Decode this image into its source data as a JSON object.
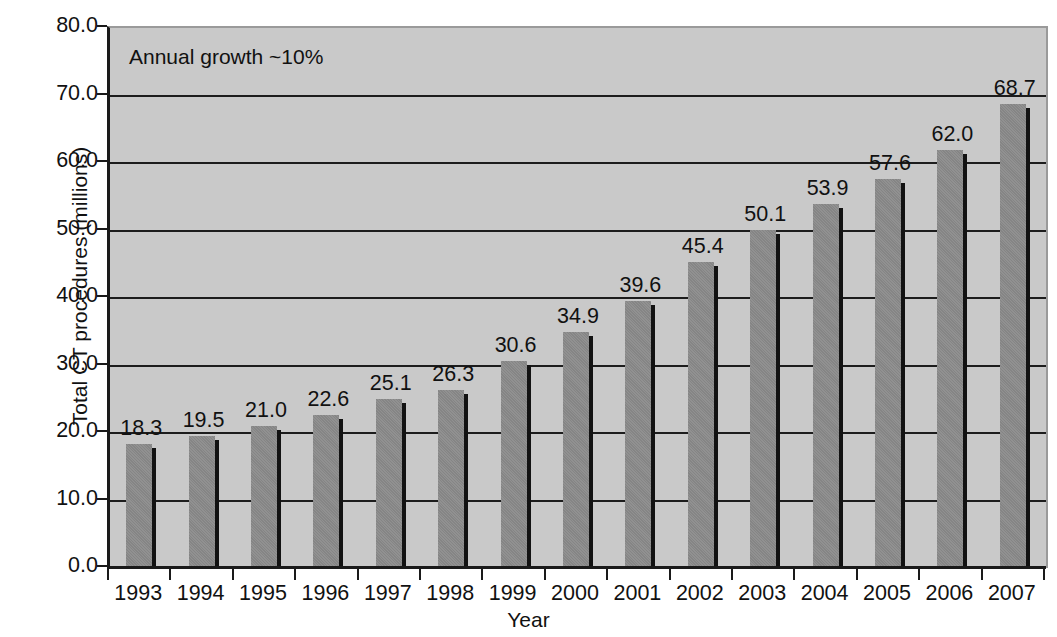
{
  "chart_data": {
    "type": "bar",
    "title": "",
    "xlabel": "Year",
    "ylabel": "Total CT procedures (millions)",
    "categories": [
      "1993",
      "1994",
      "1995",
      "1996",
      "1997",
      "1998",
      "1999",
      "2000",
      "2001",
      "2002",
      "2003",
      "2004",
      "2005",
      "2006",
      "2007"
    ],
    "values": [
      18.3,
      19.5,
      21.0,
      22.6,
      25.1,
      26.3,
      30.6,
      34.9,
      39.6,
      45.4,
      50.1,
      53.9,
      57.6,
      62.0,
      68.7
    ],
    "value_labels": [
      "18.3",
      "19.5",
      "21.0",
      "22.6",
      "25.1",
      "26.3",
      "30.6",
      "34.9",
      "39.6",
      "45.4",
      "50.1",
      "53.9",
      "57.6",
      "62.0",
      "68.7"
    ],
    "ylim": [
      0,
      80
    ],
    "yticks": [
      0,
      10,
      20,
      30,
      40,
      50,
      60,
      70,
      80
    ],
    "ytick_labels": [
      "0.0",
      "10.0",
      "20.0",
      "30.0",
      "40.0",
      "50.0",
      "60.0",
      "70.0",
      "80.0"
    ],
    "grid": true,
    "grid_axis": "y",
    "legend": "none",
    "annotations": [
      {
        "text": "Annual growth ~10%",
        "x": 1993.0,
        "y": 77.0
      }
    ],
    "colors": {
      "bar_fill": "#8b8b8b",
      "bar_shadow": "#121212",
      "plot_background": "#c9c9c9",
      "gridline": "#1c1c1c",
      "axis": "#1a1a1a",
      "text": "#111111",
      "figure_background": "#ffffff"
    }
  },
  "axes": {
    "y_title": "Total CT procedures (millions)",
    "x_title": "Year",
    "annotation": "Annual growth ~10%"
  }
}
